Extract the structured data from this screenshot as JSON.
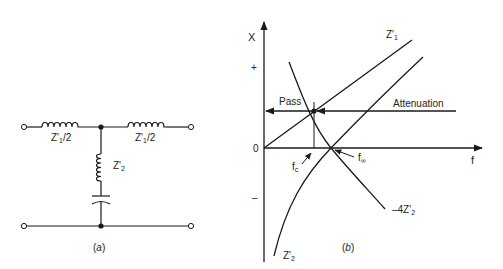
{
  "figure_a": {
    "caption_open": "(",
    "caption_letter": "a",
    "caption_close": ")",
    "series_left_label": {
      "base": "Z'",
      "sub": "1",
      "tail": "/2"
    },
    "series_right_label": {
      "base": "Z'",
      "sub": "1",
      "tail": "/2"
    },
    "shunt_label": {
      "base": "Z'",
      "sub": "2"
    }
  },
  "figure_b": {
    "caption_open": "(",
    "caption_letter": "b",
    "caption_close": ")",
    "y_axis_label": "X",
    "x_axis_label": "f",
    "plus_tick": "+",
    "minus_tick": "–",
    "origin_label": "0",
    "pass_label": "Pass",
    "attenuation_label": "Attenuation",
    "fc_label": {
      "base": "f",
      "sub": "c"
    },
    "finf_label": {
      "base": "f",
      "sub": "∞"
    },
    "z1_label": {
      "base": "Z'",
      "sub": "1"
    },
    "z2_label": {
      "base": "Z'",
      "sub": "2"
    },
    "minus4z2_label": {
      "base": "–4Z'",
      "sub": "2"
    }
  },
  "colors": {
    "ink": "#1a1a1a",
    "background": "#ffffff"
  }
}
